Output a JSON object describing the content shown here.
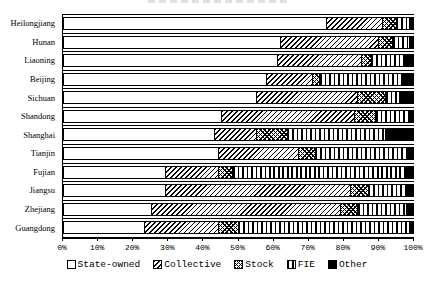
{
  "colors": {
    "ink": "#000000",
    "paper": "#ffffff"
  },
  "chart_data": {
    "type": "bar",
    "orientation": "horizontal",
    "stacked": true,
    "unit": "%",
    "grid": "category-separator-lines",
    "categories": [
      "Heilongjiang",
      "Hunan",
      "Liaoning",
      "Beijing",
      "Sichuan",
      "Shandong",
      "Shanghai",
      "Tianjin",
      "Fujian",
      "Jiangsu",
      "Zhejiang",
      "Guangdong"
    ],
    "series": [
      {
        "name": "State-owned",
        "pattern": "solid-white",
        "values": [
          75,
          62,
          61,
          58,
          55,
          45,
          43,
          44,
          29,
          29,
          25,
          23
        ]
      },
      {
        "name": "Collective",
        "pattern": "diagonal-hatch",
        "values": [
          16,
          28,
          24,
          13,
          29,
          38,
          12,
          23,
          15,
          53,
          54,
          21
        ]
      },
      {
        "name": "Stock",
        "pattern": "crosshatch",
        "values": [
          4,
          4,
          3,
          2,
          8,
          6,
          9,
          5,
          4,
          5,
          5,
          6
        ]
      },
      {
        "name": "FIE",
        "pattern": "vertical-lines",
        "values": [
          4,
          5,
          9,
          24,
          4,
          10,
          28,
          26,
          50,
          11,
          14,
          49
        ]
      },
      {
        "name": "Other",
        "pattern": "solid-black",
        "values": [
          1,
          1,
          3,
          3,
          4,
          1,
          8,
          2,
          2,
          2,
          2,
          1
        ]
      }
    ],
    "x_axis": {
      "range": [
        0,
        100
      ],
      "ticks": [
        "0%",
        "10%",
        "20%",
        "30%",
        "40%",
        "50%",
        "60%",
        "70%",
        "80%",
        "90%",
        "100%"
      ]
    },
    "legend": {
      "position": "bottom"
    }
  }
}
